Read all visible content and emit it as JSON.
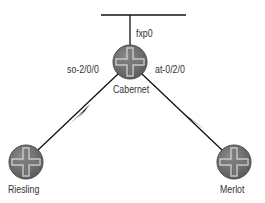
{
  "diagram": {
    "network": {
      "label": "fxp0"
    },
    "routers": [
      {
        "name": "Cabernet",
        "cx": 130,
        "cy": 62
      },
      {
        "name": "Riesling",
        "cx": 26,
        "cy": 162
      },
      {
        "name": "Merlot",
        "cx": 234,
        "cy": 162
      }
    ],
    "links": [
      {
        "from": "Cabernet",
        "to": "Riesling",
        "interface": "so-2/0/0",
        "type": "serial"
      },
      {
        "from": "Cabernet",
        "to": "Merlot",
        "interface": "at-0/2/0",
        "type": "serial"
      }
    ],
    "colors": {
      "router_fill": "#6e6e6e",
      "router_edge": "#4a4a4a",
      "cross": "#bdbdbd",
      "line": "#111111"
    }
  }
}
